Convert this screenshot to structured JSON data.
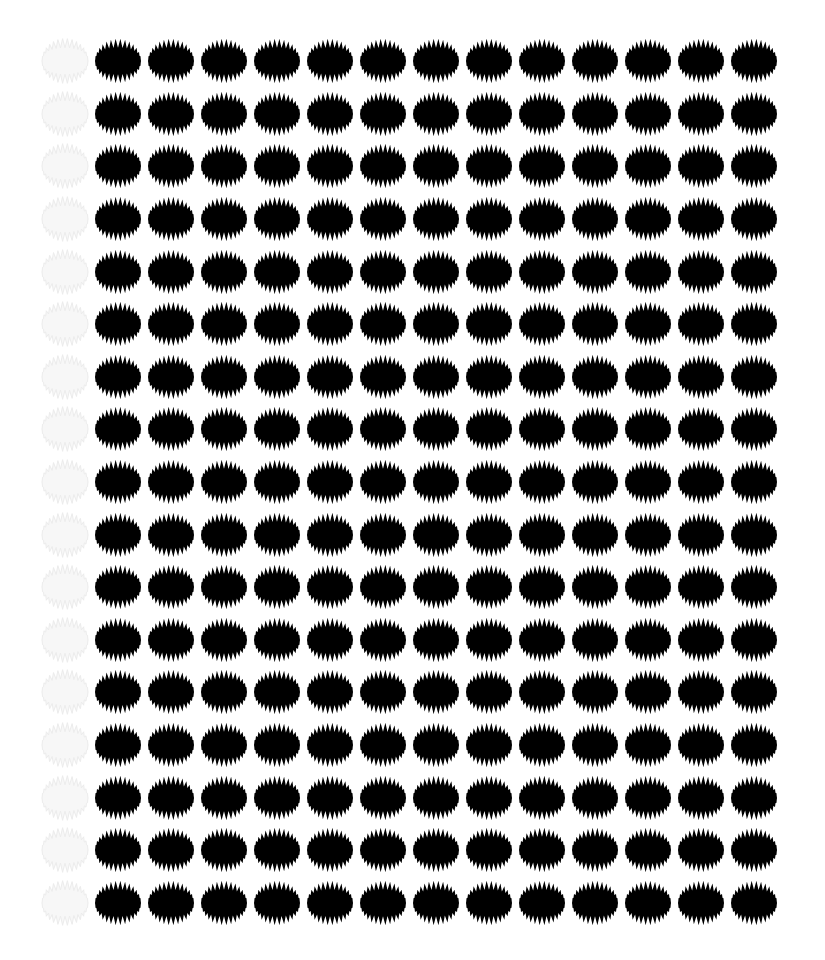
{
  "pattern": {
    "rows": 17,
    "columns": 14,
    "ghost_columns": [
      0
    ],
    "shape": "spiky-ellipse",
    "colors": {
      "background": "#ffffff",
      "shape_fill": "#000000",
      "ghost_fill": "#f7f7f7",
      "ghost_stroke": "#ececec"
    }
  }
}
